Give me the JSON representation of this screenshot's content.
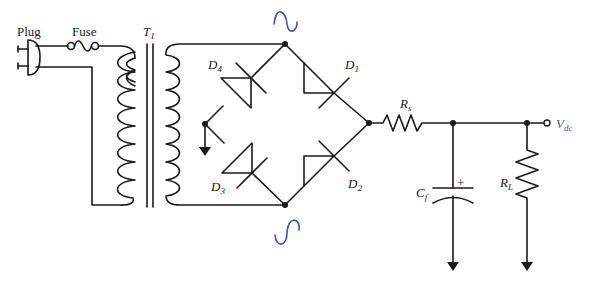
{
  "diagram": {
    "type": "full-wave bridge rectifier with RC filter",
    "labels": {
      "plug": "Plug",
      "fuse": "Fuse",
      "transformer": {
        "main": "T",
        "sub": "1"
      },
      "d1": {
        "main": "D",
        "sub": "1"
      },
      "d2": {
        "main": "D",
        "sub": "2"
      },
      "d3": {
        "main": "D",
        "sub": "3"
      },
      "d4": {
        "main": "D",
        "sub": "4"
      },
      "rs": {
        "main": "R",
        "sub": "s"
      },
      "cf": {
        "main": "C",
        "sub": "f"
      },
      "rl": {
        "main": "R",
        "sub": "L"
      },
      "vdc": {
        "main": "V",
        "sub": "dc"
      },
      "cap_polarity": "+"
    },
    "annotations": {
      "ac_top": "sine-wave-symbol",
      "ac_bottom": "sine-wave-symbol",
      "annotation_color": "#3d52b0"
    },
    "components": [
      {
        "id": "plug",
        "kind": "ac-plug"
      },
      {
        "id": "fuse",
        "kind": "fuse"
      },
      {
        "id": "T1",
        "kind": "transformer"
      },
      {
        "id": "D1",
        "kind": "diode"
      },
      {
        "id": "D2",
        "kind": "diode"
      },
      {
        "id": "D3",
        "kind": "diode"
      },
      {
        "id": "D4",
        "kind": "diode"
      },
      {
        "id": "Rs",
        "kind": "resistor"
      },
      {
        "id": "Cf",
        "kind": "polarized-capacitor"
      },
      {
        "id": "RL",
        "kind": "resistor"
      },
      {
        "id": "Vdc",
        "kind": "output-terminal"
      }
    ],
    "colors": {
      "ink": "#1a1a1a",
      "vdc_label": "#4a5aa8",
      "background": "#ffffff"
    }
  }
}
